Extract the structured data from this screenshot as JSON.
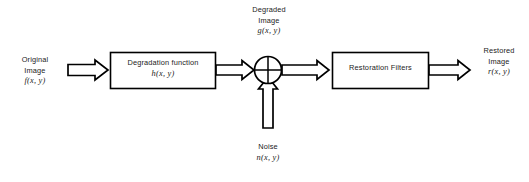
{
  "diagram": {
    "stroke_color": "#000000",
    "fill_color": "#ffffff",
    "text_color": "#1b1b1b",
    "background": "#ffffff"
  },
  "labels": {
    "original": {
      "line1": "Original",
      "line2": "Image",
      "math": "f(x, y)"
    },
    "degraded": {
      "line1": "Degraded",
      "line2": "Image",
      "math": "g(x, y)"
    },
    "noise": {
      "line1": "Noise",
      "math": "n(x, y)"
    },
    "restored": {
      "line1": "Restored",
      "line2": "Image",
      "math": "r(x, y)"
    }
  },
  "blocks": {
    "degradation": {
      "line1": "Degradation function",
      "math": "h(x, y)"
    },
    "restoration": {
      "line1": "Restoration Filters"
    }
  },
  "junction": {
    "name": "summing-junction",
    "glyph": "crossed-circle"
  },
  "arrows": {
    "input_to_degradation": "arrow-right",
    "degradation_to_junction": "arrow-right",
    "noise_to_junction": "arrow-up",
    "junction_to_restoration": "arrow-right",
    "restoration_to_output": "arrow-right"
  }
}
